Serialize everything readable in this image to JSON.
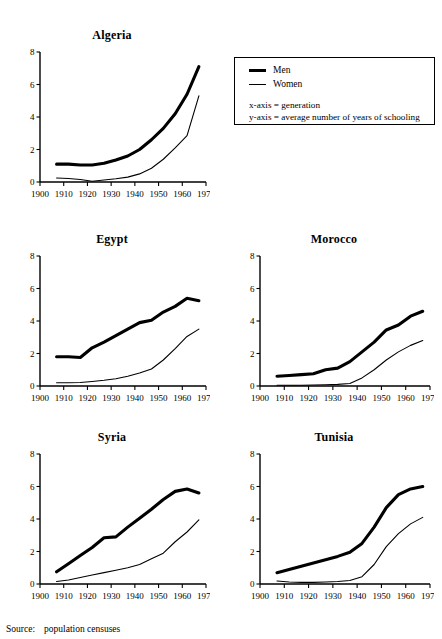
{
  "running_header": "",
  "legend": {
    "series": [
      {
        "label": "Men",
        "style": "thick"
      },
      {
        "label": "Women",
        "style": "thin"
      }
    ],
    "notes": [
      "x-axis = generation",
      "y-axis = average number of years of schooling"
    ]
  },
  "footer": {
    "label": "Source:",
    "text": "population censuses"
  },
  "axis": {
    "xlabel": "generation",
    "ylabel": "average number of years of schooling",
    "xticks": [
      "1900",
      "1910",
      "1920",
      "1930",
      "1940",
      "1950",
      "1960",
      "1970"
    ],
    "yticks": [
      "0",
      "2",
      "4",
      "6",
      "8"
    ],
    "xlim": [
      1900,
      1970
    ],
    "ylim": [
      0,
      8
    ]
  },
  "chart_data": [
    {
      "type": "line",
      "title": "Algeria",
      "xlabel": "generation",
      "ylabel": "average number of years of schooling",
      "xlim": [
        1900,
        1970
      ],
      "ylim": [
        0,
        8
      ],
      "xticks": [
        1900,
        1910,
        1920,
        1930,
        1940,
        1950,
        1960,
        1970
      ],
      "yticks": [
        0,
        2,
        4,
        6,
        8
      ],
      "grid": false,
      "legend": "external",
      "series": [
        {
          "name": "Men",
          "x": [
            1907,
            1912,
            1917,
            1922,
            1927,
            1932,
            1937,
            1942,
            1947,
            1952,
            1957,
            1962,
            1967
          ],
          "values": [
            1.1,
            1.1,
            1.05,
            1.05,
            1.15,
            1.35,
            1.6,
            2.0,
            2.6,
            3.3,
            4.2,
            5.4,
            7.1
          ]
        },
        {
          "name": "Women",
          "x": [
            1907,
            1912,
            1917,
            1922,
            1927,
            1932,
            1937,
            1942,
            1947,
            1952,
            1957,
            1962,
            1967
          ],
          "values": [
            0.25,
            0.22,
            0.15,
            0.05,
            0.12,
            0.2,
            0.3,
            0.5,
            0.85,
            1.4,
            2.1,
            2.85,
            5.3
          ]
        }
      ]
    },
    {
      "type": "line",
      "title": "Egypt",
      "xlabel": "generation",
      "ylabel": "average number of years of schooling",
      "xlim": [
        1900,
        1970
      ],
      "ylim": [
        0,
        8
      ],
      "xticks": [
        1900,
        1910,
        1920,
        1930,
        1940,
        1950,
        1960,
        1970
      ],
      "yticks": [
        0,
        2,
        4,
        6,
        8
      ],
      "grid": false,
      "legend": "external",
      "series": [
        {
          "name": "Men",
          "x": [
            1907,
            1912,
            1917,
            1922,
            1927,
            1932,
            1937,
            1942,
            1947,
            1952,
            1957,
            1962,
            1967
          ],
          "values": [
            1.8,
            1.8,
            1.75,
            2.35,
            2.7,
            3.1,
            3.5,
            3.9,
            4.05,
            4.55,
            4.9,
            5.4,
            5.25
          ]
        },
        {
          "name": "Women",
          "x": [
            1907,
            1912,
            1917,
            1922,
            1927,
            1932,
            1937,
            1942,
            1947,
            1952,
            1957,
            1962,
            1967
          ],
          "values": [
            0.2,
            0.2,
            0.22,
            0.28,
            0.35,
            0.45,
            0.6,
            0.8,
            1.05,
            1.6,
            2.3,
            3.05,
            3.5
          ]
        }
      ]
    },
    {
      "type": "line",
      "title": "Morocco",
      "xlabel": "generation",
      "ylabel": "average number of years of schooling",
      "xlim": [
        1900,
        1970
      ],
      "ylim": [
        0,
        8
      ],
      "xticks": [
        1900,
        1910,
        1920,
        1930,
        1940,
        1950,
        1960,
        1970
      ],
      "yticks": [
        0,
        2,
        4,
        6,
        8
      ],
      "grid": false,
      "legend": "external",
      "series": [
        {
          "name": "Men",
          "x": [
            1907,
            1912,
            1917,
            1922,
            1927,
            1932,
            1937,
            1942,
            1947,
            1952,
            1957,
            1962,
            1967
          ],
          "values": [
            0.6,
            0.65,
            0.7,
            0.75,
            1.0,
            1.1,
            1.5,
            2.1,
            2.7,
            3.45,
            3.75,
            4.3,
            4.6
          ]
        },
        {
          "name": "Women",
          "x": [
            1907,
            1912,
            1917,
            1922,
            1927,
            1932,
            1937,
            1942,
            1947,
            1952,
            1957,
            1962,
            1967
          ],
          "values": [
            0.05,
            0.05,
            0.05,
            0.06,
            0.08,
            0.1,
            0.15,
            0.5,
            1.0,
            1.6,
            2.1,
            2.5,
            2.8
          ]
        }
      ]
    },
    {
      "type": "line",
      "title": "Syria",
      "xlabel": "generation",
      "ylabel": "average number of years of schooling",
      "xlim": [
        1900,
        1970
      ],
      "ylim": [
        0,
        8
      ],
      "xticks": [
        1900,
        1910,
        1920,
        1930,
        1940,
        1950,
        1960,
        1970
      ],
      "yticks": [
        0,
        2,
        4,
        6,
        8
      ],
      "grid": false,
      "legend": "external",
      "series": [
        {
          "name": "Men",
          "x": [
            1907,
            1912,
            1917,
            1922,
            1927,
            1932,
            1937,
            1942,
            1947,
            1952,
            1957,
            1962,
            1967
          ],
          "values": [
            0.75,
            1.25,
            1.75,
            2.25,
            2.85,
            2.9,
            3.5,
            4.05,
            4.6,
            5.2,
            5.7,
            5.85,
            5.6
          ]
        },
        {
          "name": "Women",
          "x": [
            1907,
            1912,
            1917,
            1922,
            1927,
            1932,
            1937,
            1942,
            1947,
            1952,
            1957,
            1962,
            1967
          ],
          "values": [
            0.15,
            0.25,
            0.4,
            0.55,
            0.7,
            0.85,
            1.0,
            1.2,
            1.55,
            1.9,
            2.6,
            3.2,
            3.95
          ]
        }
      ]
    },
    {
      "type": "line",
      "title": "Tunisia",
      "xlabel": "generation",
      "ylabel": "average number of years of schooling",
      "xlim": [
        1900,
        1970
      ],
      "ylim": [
        0,
        8
      ],
      "xticks": [
        1900,
        1910,
        1920,
        1930,
        1940,
        1950,
        1960,
        1970
      ],
      "yticks": [
        0,
        2,
        4,
        6,
        8
      ],
      "grid": false,
      "legend": "external",
      "series": [
        {
          "name": "Men",
          "x": [
            1907,
            1912,
            1917,
            1922,
            1927,
            1932,
            1937,
            1942,
            1947,
            1952,
            1957,
            1962,
            1967
          ],
          "values": [
            0.7,
            0.9,
            1.1,
            1.3,
            1.5,
            1.7,
            1.95,
            2.5,
            3.5,
            4.7,
            5.5,
            5.85,
            6.0
          ]
        },
        {
          "name": "Women",
          "x": [
            1907,
            1912,
            1917,
            1922,
            1927,
            1932,
            1937,
            1942,
            1947,
            1952,
            1957,
            1962,
            1967
          ],
          "values": [
            0.18,
            0.12,
            0.1,
            0.1,
            0.12,
            0.15,
            0.22,
            0.45,
            1.2,
            2.3,
            3.1,
            3.7,
            4.1
          ]
        }
      ]
    }
  ]
}
